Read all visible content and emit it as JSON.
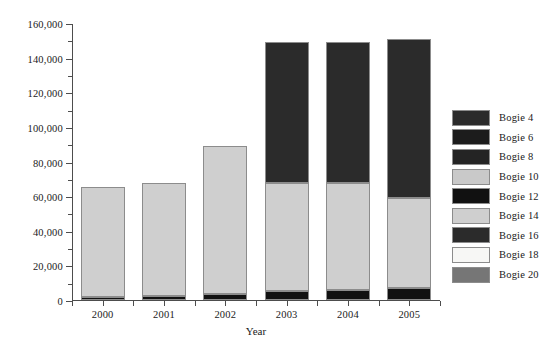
{
  "chart_data": {
    "type": "bar",
    "stacked": true,
    "title": "",
    "subtitle": "",
    "xlabel": "Year",
    "ylabel": "",
    "categories": [
      "2000",
      "2001",
      "2002",
      "2003",
      "2004",
      "2005"
    ],
    "ylim": [
      0,
      160000
    ],
    "ytick_values": [
      0,
      20000,
      40000,
      60000,
      80000,
      100000,
      120000,
      140000,
      160000
    ],
    "ytick_labels": [
      "0",
      "20,000",
      "40,000",
      "60,000",
      "80,000",
      "100,000",
      "120,000",
      "140,000",
      "160,000"
    ],
    "ytick_minor_interval": 10000,
    "grid": false,
    "legend_position": "right",
    "series": [
      {
        "name": "Bogie 4",
        "color": "#2b2b2b",
        "values": [
          0,
          0,
          0,
          0,
          0,
          0
        ]
      },
      {
        "name": "Bogie 6",
        "color": "#1c1c1c",
        "values": [
          0,
          0,
          0,
          0,
          0,
          0
        ]
      },
      {
        "name": "Bogie 8",
        "color": "#242424",
        "values": [
          0,
          0,
          0,
          0,
          0,
          0
        ]
      },
      {
        "name": "Bogie 10",
        "color": "#c9c9c9",
        "values": [
          0,
          0,
          0,
          0,
          0,
          0
        ]
      },
      {
        "name": "Bogie 12",
        "color": "#111111",
        "values": [
          1800,
          2100,
          3200,
          5200,
          6000,
          6800
        ]
      },
      {
        "name": "Bogie 14",
        "color": "#cfcfcf",
        "values": [
          63500,
          65400,
          85800,
          62300,
          61500,
          52200
        ]
      },
      {
        "name": "Bogie 16",
        "color": "#2b2b2b",
        "values": [
          0,
          0,
          0,
          81500,
          81500,
          92000
        ]
      },
      {
        "name": "Bogie 18",
        "color": "#f7f7f5",
        "values": [
          0,
          0,
          0,
          0,
          0,
          0
        ]
      },
      {
        "name": "Bogie 20",
        "color": "#767676",
        "values": [
          0,
          0,
          0,
          0,
          0,
          0
        ]
      }
    ],
    "totals": [
      65300,
      67500,
      89000,
      149000,
      149000,
      151000
    ]
  },
  "legend": {
    "items": [
      {
        "label": "Bogie 4",
        "color": "#2b2b2b"
      },
      {
        "label": "Bogie 6",
        "color": "#1c1c1c"
      },
      {
        "label": "Bogie 8",
        "color": "#242424"
      },
      {
        "label": "Bogie 10",
        "color": "#c9c9c9"
      },
      {
        "label": "Bogie 12",
        "color": "#111111"
      },
      {
        "label": "Bogie 14",
        "color": "#cfcfcf"
      },
      {
        "label": "Bogie 16",
        "color": "#2b2b2b"
      },
      {
        "label": "Bogie 18",
        "color": "#f7f7f5"
      },
      {
        "label": "Bogie 20",
        "color": "#767676"
      }
    ]
  },
  "axis": {
    "x_title": "Year"
  },
  "style": {
    "axis_color": "#4d4d4d",
    "bar_edge_color": "#8c8c8c",
    "background": "#ffffff"
  }
}
